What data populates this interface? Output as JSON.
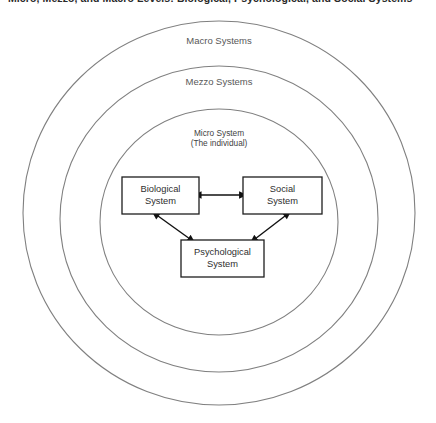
{
  "figure": {
    "caption_clipped": "Micro, Mezzo, and Macro Levels: Biological, Psychological, and Social Systems",
    "background_color": "#ffffff",
    "ring_stroke_color": "#808080",
    "box_stroke_color": "#1e1e1e",
    "arrow_color": "#111111"
  },
  "rings": [
    {
      "name": "macro",
      "label": "Macro Systems",
      "cx": 219,
      "cy": 213,
      "rx": 196,
      "ry": 192,
      "label_x": 219,
      "label_y": 41
    },
    {
      "name": "mezzo",
      "label": "Mezzo Systems",
      "cx": 219,
      "cy": 219,
      "rx": 159,
      "ry": 153,
      "label_x": 219,
      "label_y": 82
    },
    {
      "name": "micro",
      "label": "",
      "cx": 219,
      "cy": 222,
      "rx": 119,
      "ry": 113,
      "label_x": 219,
      "label_y": 0
    }
  ],
  "center_label": {
    "line1": "Micro System",
    "line2": "(The individual)",
    "x": 219,
    "y": 133
  },
  "boxes": [
    {
      "name": "biological-system",
      "line1": "Biological",
      "line2": "System",
      "x": 122,
      "y": 177,
      "w": 77,
      "h": 37
    },
    {
      "name": "social-system",
      "line1": "Social",
      "line2": "System",
      "x": 243,
      "y": 177,
      "w": 79,
      "h": 37
    },
    {
      "name": "psychological-system",
      "line1": "Psychological",
      "line2": "System",
      "x": 181,
      "y": 240,
      "w": 83,
      "h": 37
    }
  ],
  "connectors": [
    {
      "name": "biological-social-arrow",
      "from": "biological-system",
      "to": "social-system",
      "style": "double-headed",
      "x1": 201,
      "y1": 195,
      "x2": 241,
      "y2": 195
    },
    {
      "name": "biological-psychological-arrow",
      "from": "biological-system",
      "to": "psychological-system",
      "style": "double-headed",
      "x1": 158,
      "y1": 216,
      "x2": 190,
      "y2": 239
    },
    {
      "name": "social-psychological-arrow",
      "from": "social-system",
      "to": "psychological-system",
      "style": "double-headed",
      "x1": 285,
      "y1": 216,
      "x2": 255,
      "y2": 239
    }
  ]
}
